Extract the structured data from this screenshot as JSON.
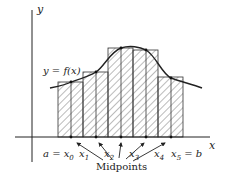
{
  "diagram": {
    "type": "midpoint-riemann-sum",
    "axis_labels": {
      "x": "x",
      "y": "y"
    },
    "curve_label": "y = f(x)",
    "tick_labels": [
      {
        "text": "a = x",
        "sub": "0",
        "x": 43
      },
      {
        "text": "x",
        "sub": "1",
        "x": 79
      },
      {
        "text": "x",
        "sub": "2",
        "x": 104
      },
      {
        "text": "x",
        "sub": "3",
        "x": 129
      },
      {
        "text": "x",
        "sub": "4",
        "x": 154
      },
      {
        "text": "x",
        "sub": "5",
        "suffix": " = b",
        "x": 171
      }
    ],
    "midpoints_label": "Midpoints",
    "rectangles": [
      {
        "x0": 58,
        "x1": 83,
        "top": 82
      },
      {
        "x0": 83,
        "x1": 108,
        "top": 72
      },
      {
        "x0": 108,
        "x1": 133,
        "top": 48
      },
      {
        "x0": 133,
        "x1": 158,
        "top": 50
      },
      {
        "x0": 158,
        "x1": 183,
        "top": 77
      }
    ],
    "midpoints": [
      71,
      96,
      121,
      146,
      171
    ],
    "colors": {
      "line": "#222222",
      "hatch": "#555555",
      "background": "#ffffff"
    }
  }
}
